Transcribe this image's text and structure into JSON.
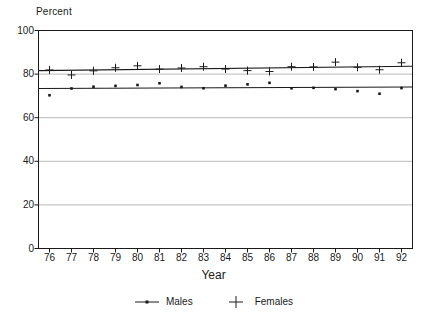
{
  "chart_data": {
    "type": "line",
    "title": "",
    "subtitle": "",
    "xlabel": "Year",
    "ylabel": "Percent",
    "ylim": [
      0,
      100
    ],
    "yticks": [
      0,
      20,
      40,
      60,
      80,
      100
    ],
    "grid": true,
    "grid_axis": "y",
    "legend_position": "bottom-center",
    "categories": [
      "76",
      "77",
      "78",
      "79",
      "80",
      "81",
      "82",
      "83",
      "84",
      "85",
      "86",
      "87",
      "88",
      "89",
      "90",
      "91",
      "92"
    ],
    "x": [
      1976,
      1977,
      1978,
      1979,
      1980,
      1981,
      1982,
      1983,
      1984,
      1985,
      1986,
      1987,
      1988,
      1989,
      1990,
      1991,
      1992
    ],
    "series": [
      {
        "name": "Males",
        "marker": "dot",
        "values": [
          70.3,
          73.4,
          74.2,
          74.6,
          75.0,
          75.8,
          74.1,
          73.5,
          74.7,
          75.3,
          76.0,
          73.5,
          73.7,
          73.1,
          72.2,
          71.0,
          73.6
        ],
        "trend_start": 73.4,
        "trend_end": 74.1
      },
      {
        "name": "Females",
        "marker": "plus",
        "values": [
          81.9,
          79.6,
          81.5,
          82.9,
          83.8,
          82.3,
          82.8,
          83.4,
          82.3,
          81.6,
          81.2,
          83.4,
          83.3,
          85.5,
          83.1,
          82.0,
          85.2
        ],
        "trend_start": 81.6,
        "trend_end": 83.6
      }
    ],
    "colors": {
      "axis": "#1a1a1a",
      "grid": "#b9b9b9",
      "males": "#1a1a1a",
      "females": "#1a1a1a",
      "background": "#ffffff"
    }
  },
  "legend": {
    "entries": [
      {
        "label": "Males",
        "marker": "dot-line-marker"
      },
      {
        "label": "Females",
        "marker": "plus-marker"
      }
    ]
  }
}
